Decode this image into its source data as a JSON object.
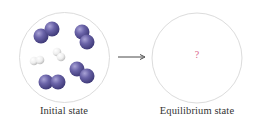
{
  "diagram": {
    "title": "",
    "panels": [
      {
        "id": "initial",
        "label": "Initial state",
        "circle": {
          "cx": 64.5,
          "cy": 57.5,
          "r": 45
        },
        "molecules": [
          {
            "type": "diatomic-large",
            "color": "#6a63a8",
            "atoms": [
              {
                "cx": 41,
                "cy": 36,
                "r": 7.5
              },
              {
                "cx": 52,
                "cy": 29,
                "r": 7.5
              }
            ]
          },
          {
            "type": "diatomic-large",
            "color": "#6a63a8",
            "atoms": [
              {
                "cx": 82,
                "cy": 32,
                "r": 7.5
              },
              {
                "cx": 87,
                "cy": 42,
                "r": 7.5
              }
            ]
          },
          {
            "type": "diatomic-small",
            "color": "#f2f2f2",
            "atoms": [
              {
                "cx": 57,
                "cy": 52,
                "r": 4.3
              },
              {
                "cx": 61,
                "cy": 57,
                "r": 4.3
              }
            ]
          },
          {
            "type": "diatomic-small",
            "color": "#f2f2f2",
            "atoms": [
              {
                "cx": 34,
                "cy": 61,
                "r": 4.3
              },
              {
                "cx": 40,
                "cy": 60,
                "r": 4.3
              }
            ]
          },
          {
            "type": "diatomic-large",
            "color": "#6a63a8",
            "atoms": [
              {
                "cx": 77,
                "cy": 69,
                "r": 7.5
              },
              {
                "cx": 87,
                "cy": 76,
                "r": 7.5
              }
            ]
          },
          {
            "type": "diatomic-large",
            "color": "#6a63a8",
            "atoms": [
              {
                "cx": 46,
                "cy": 82,
                "r": 7.5
              },
              {
                "cx": 58,
                "cy": 82,
                "r": 7.5
              }
            ]
          }
        ]
      },
      {
        "id": "equilibrium",
        "label": "Equilibrium state",
        "circle": {
          "cx": 197,
          "cy": 58,
          "r": 45
        },
        "content": "?",
        "content_color": "#d9668c"
      }
    ],
    "arrow": {
      "x1": 118,
      "y1": 57,
      "x2": 145,
      "y2": 57,
      "color": "#333333"
    },
    "colors": {
      "circle_stroke": "#dcdcdc",
      "large_atom": "#6a63a8",
      "large_atom_highlight": "#a9a3d6",
      "large_atom_shadow": "#3f3a78",
      "small_atom": "#f4f4f4",
      "small_atom_shadow": "#bdbdbd",
      "label_text": "#333333"
    }
  }
}
